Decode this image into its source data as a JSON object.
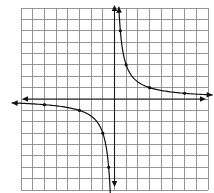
{
  "chart_data": {
    "type": "line",
    "title": "",
    "xlabel": "",
    "ylabel": "",
    "function": "y = 3/x",
    "xlim": [
      -8,
      8
    ],
    "ylim": [
      -8,
      8
    ],
    "grid": true,
    "grid_cells": {
      "columns": 16,
      "rows": 16
    },
    "axes": {
      "x_axis_arrows": true,
      "y_axis_arrows": true
    },
    "legend": null,
    "series": [
      {
        "name": "upper-right branch",
        "points": [
          {
            "x": 0.5,
            "y": 6
          },
          {
            "x": 1,
            "y": 3
          },
          {
            "x": 3,
            "y": 1
          },
          {
            "x": 6,
            "y": 0.5
          }
        ],
        "curve_start": {
          "x": 0.37,
          "y": 8.1
        },
        "curve_end": {
          "x": 8.4,
          "y": 0.357
        },
        "arrows_at_ends": true
      },
      {
        "name": "lower-left branch",
        "points": [
          {
            "x": -6,
            "y": -0.5
          },
          {
            "x": -3,
            "y": -1
          },
          {
            "x": -1,
            "y": -3
          },
          {
            "x": -0.5,
            "y": -6
          }
        ],
        "curve_start": {
          "x": -8.8,
          "y": -0.341
        },
        "curve_end": {
          "x": -0.33,
          "y": -8.3
        },
        "arrows_at_ends": true
      }
    ]
  },
  "layout": {
    "grid_left": 21,
    "grid_top": 8,
    "grid_right": 208,
    "grid_bottom": 190,
    "x_axis_extent_px": [
      22,
      206
    ],
    "y_axis_extent_px": [
      5,
      187
    ]
  },
  "colors": {
    "grid": "#8a8a8a",
    "axis": "#1a1a1a",
    "curve": "#111111",
    "background": "#ffffff"
  }
}
